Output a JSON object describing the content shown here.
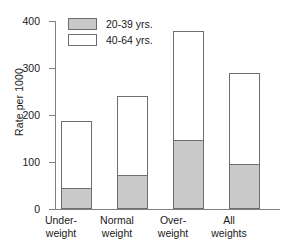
{
  "chart_data": {
    "type": "bar",
    "title": "",
    "subtitle": "",
    "stacked": true,
    "xlabel": "",
    "ylabel": "Rate per 1000",
    "ylim": [
      0,
      400
    ],
    "yticks": [
      0,
      100,
      200,
      300,
      400
    ],
    "ytick_labels": [
      "0",
      "100",
      "200",
      "300",
      "400"
    ],
    "grid": false,
    "legend_position": "top-left",
    "categories": [
      "Under-\nweight",
      "Normal\nweight",
      "Over-\nweight",
      "All\nweights"
    ],
    "category_lines": [
      [
        "Under-",
        "weight"
      ],
      [
        "Normal",
        "weight"
      ],
      [
        "Over-",
        "weight"
      ],
      [
        "All",
        "weights"
      ]
    ],
    "series": [
      {
        "name": "20-39 yrs.",
        "color": "#c9c9c9",
        "values": [
          45,
          72,
          147,
          96
        ]
      },
      {
        "name": "40-64 yrs.",
        "color": "#ffffff",
        "values": [
          145,
          171,
          234,
          196
        ]
      }
    ],
    "totals": [
      190,
      243,
      381,
      292
    ],
    "annotations": []
  },
  "legend": {
    "entries": [
      {
        "label": "20-39 yrs."
      },
      {
        "label": "40-64 yrs."
      }
    ]
  },
  "colors": {
    "axis": "#808080",
    "bar_outline": "#6e6e6e",
    "text": "#1a1a1a",
    "background": "#ffffff",
    "series_20_39": "#c9c9c9",
    "series_40_64": "#ffffff"
  }
}
